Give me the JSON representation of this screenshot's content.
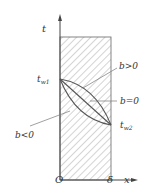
{
  "diagram": {
    "type": "temperature-distribution-plane-wall",
    "axes": {
      "y_label": "t",
      "x_label": "x",
      "origin_label": "O",
      "thickness_label": "δ"
    },
    "wall_temperatures": {
      "left": {
        "base": "t",
        "sub": "w1"
      },
      "right": {
        "base": "t",
        "sub": "w2"
      }
    },
    "curves": [
      {
        "name": "b>0",
        "label": "b>0",
        "shape": "convex"
      },
      {
        "name": "b=0",
        "label": "b=0",
        "shape": "linear"
      },
      {
        "name": "b<0",
        "label": "b<0",
        "shape": "concave"
      }
    ],
    "colors": {
      "line": "#555555",
      "hatch": "#9a9a9a",
      "text": "#333333"
    }
  }
}
